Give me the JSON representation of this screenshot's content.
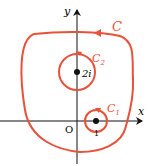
{
  "diagram": {
    "axes": {
      "x_label": "x",
      "y_label": "y",
      "origin_label": "O",
      "tick_label": "1"
    },
    "curves": [
      {
        "name": "C",
        "label": "C",
        "description": "large closed contour, counterclockwise"
      },
      {
        "name": "C2",
        "label": "C",
        "subscript": "2",
        "center_label": "2i"
      },
      {
        "name": "C1",
        "label": "C",
        "subscript": "1",
        "center_label": "1"
      }
    ],
    "colors": {
      "curve": "#e8513a",
      "axis": "#111111"
    }
  }
}
